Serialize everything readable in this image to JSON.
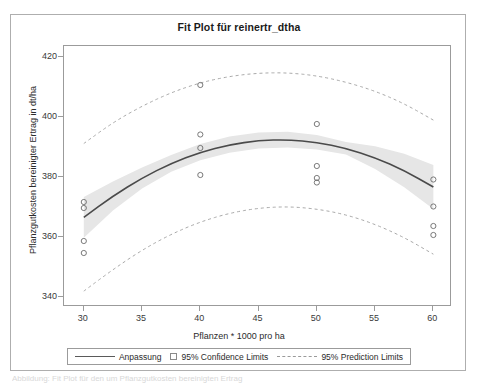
{
  "figure": {
    "title": "Fit Plot für reinertr_dtha",
    "caption": "Abbildung: Fit Plot für den um Pflanzgutkosten bereinigten Ertrag"
  },
  "legend": {
    "fit_label": "Anpassung",
    "confidence_label": "95% Confidence Limits",
    "prediction_label": "95% Prediction Limits"
  },
  "chart_data": {
    "type": "scatter",
    "title": "Fit Plot für reinertr_dtha",
    "xlabel": "Pflanzen * 1000 pro ha",
    "ylabel": "Pflanzgutkosten bereinigter Ertrag in dt/ha",
    "xlim": [
      28.3,
      61.6
    ],
    "ylim": [
      336.5,
      423.5
    ],
    "xticks": [
      30,
      35,
      40,
      45,
      50,
      55,
      60
    ],
    "yticks": [
      340,
      360,
      380,
      400,
      420
    ],
    "grid": false,
    "legend_position": "bottom",
    "points": [
      {
        "x": 30,
        "y": 371.5
      },
      {
        "x": 30,
        "y": 369.5
      },
      {
        "x": 30,
        "y": 358.5
      },
      {
        "x": 30,
        "y": 354.5
      },
      {
        "x": 40,
        "y": 410.5
      },
      {
        "x": 40,
        "y": 394.0
      },
      {
        "x": 40,
        "y": 389.5
      },
      {
        "x": 40,
        "y": 380.5
      },
      {
        "x": 50,
        "y": 397.5
      },
      {
        "x": 50,
        "y": 383.5
      },
      {
        "x": 50,
        "y": 379.5
      },
      {
        "x": 50,
        "y": 378.0
      },
      {
        "x": 60,
        "y": 379.0
      },
      {
        "x": 60,
        "y": 370.0
      },
      {
        "x": 60,
        "y": 363.5
      },
      {
        "x": 60,
        "y": 360.5
      }
    ],
    "series": [
      {
        "name": "Anpassung",
        "type": "line",
        "x": [
          30,
          32.5,
          35,
          37.5,
          40,
          42.5,
          45,
          47.5,
          50,
          52.5,
          55,
          57.5,
          60
        ],
        "values": [
          366.4,
          373.5,
          379.5,
          384.4,
          388.1,
          390.6,
          392.0,
          392.3,
          391.4,
          389.4,
          386.3,
          382.0,
          376.5
        ]
      },
      {
        "name": "95% Confidence Limits upper",
        "type": "band-upper",
        "x": [
          30,
          32.5,
          35,
          37.5,
          40,
          42.5,
          45,
          47.5,
          50,
          52.5,
          55,
          57.5,
          60
        ],
        "values": [
          373.2,
          378.3,
          383.0,
          387.2,
          390.8,
          393.3,
          394.7,
          394.9,
          393.8,
          391.5,
          390.1,
          387.6,
          383.8
        ]
      },
      {
        "name": "95% Confidence Limits lower",
        "type": "band-lower",
        "x": [
          30,
          32.5,
          35,
          37.5,
          40,
          42.5,
          45,
          47.5,
          50,
          52.5,
          55,
          57.5,
          60
        ],
        "values": [
          359.6,
          368.7,
          376.0,
          381.6,
          385.4,
          387.9,
          389.3,
          389.7,
          389.0,
          387.3,
          382.5,
          376.4,
          369.2
        ]
      },
      {
        "name": "95% Prediction Limits upper",
        "type": "dashed-upper",
        "x": [
          30,
          32.5,
          35,
          37.5,
          40,
          42.5,
          45,
          47.5,
          50,
          52.5,
          55,
          57.5,
          60
        ],
        "values": [
          391.0,
          398.0,
          403.5,
          408.0,
          411.3,
          413.4,
          414.5,
          414.6,
          413.6,
          411.5,
          408.5,
          404.3,
          398.8
        ]
      },
      {
        "name": "95% Prediction Limits lower",
        "type": "dashed-lower",
        "x": [
          30,
          32.5,
          35,
          37.5,
          40,
          42.5,
          45,
          47.5,
          50,
          52.5,
          55,
          57.5,
          60
        ],
        "values": [
          341.8,
          349.0,
          355.5,
          360.8,
          364.9,
          367.8,
          369.5,
          370.0,
          369.2,
          367.3,
          364.1,
          359.7,
          354.1
        ]
      }
    ],
    "colors": {
      "fit_line": "#4a4a4a",
      "confidence_band": "#e6e6e6",
      "prediction_line": "#a9a9a9",
      "marker_stroke": "#6b6b6b",
      "axis": "#9b9b9b",
      "text": "#2b2b2b"
    }
  }
}
